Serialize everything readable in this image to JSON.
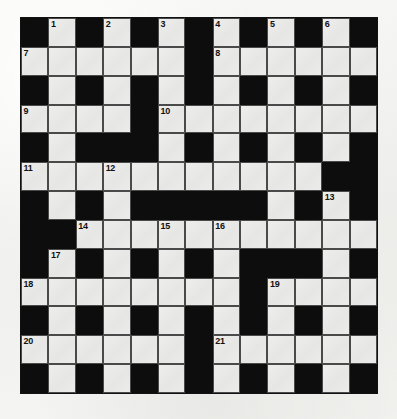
{
  "puzzle": {
    "type": "crossword-grid",
    "title": "Crossword Puzzle Grid",
    "columns": 13,
    "rows": 13,
    "colors": {
      "block": "#0d0d0d",
      "cell": "#e9e9e7",
      "cell_border": "#4a4a4a",
      "number_text": "#121212",
      "page_background": "#f2f2f0"
    },
    "legend": {
      "black": "blocked square",
      "white": "fillable letter square"
    },
    "grid": [
      [
        "black",
        "white",
        "black",
        "white",
        "black",
        "white",
        "black",
        "white",
        "black",
        "white",
        "black",
        "white",
        "black"
      ],
      [
        "white",
        "white",
        "white",
        "white",
        "white",
        "white",
        "black",
        "white",
        "white",
        "white",
        "white",
        "white",
        "white"
      ],
      [
        "black",
        "white",
        "black",
        "white",
        "black",
        "white",
        "black",
        "white",
        "black",
        "white",
        "black",
        "white",
        "black"
      ],
      [
        "white",
        "white",
        "white",
        "white",
        "black",
        "white",
        "white",
        "white",
        "white",
        "white",
        "white",
        "white",
        "white"
      ],
      [
        "black",
        "white",
        "black",
        "black",
        "black",
        "white",
        "black",
        "white",
        "black",
        "white",
        "black",
        "white",
        "black"
      ],
      [
        "white",
        "white",
        "white",
        "white",
        "white",
        "white",
        "white",
        "white",
        "white",
        "white",
        "white",
        "black",
        "black"
      ],
      [
        "black",
        "white",
        "black",
        "white",
        "black",
        "black",
        "black",
        "black",
        "black",
        "white",
        "black",
        "white",
        "black"
      ],
      [
        "black",
        "black",
        "white",
        "white",
        "white",
        "white",
        "white",
        "white",
        "white",
        "white",
        "white",
        "white",
        "white"
      ],
      [
        "black",
        "white",
        "black",
        "white",
        "black",
        "white",
        "black",
        "white",
        "black",
        "black",
        "black",
        "white",
        "black"
      ],
      [
        "white",
        "white",
        "white",
        "white",
        "white",
        "white",
        "white",
        "white",
        "black",
        "white",
        "white",
        "white",
        "white"
      ],
      [
        "black",
        "white",
        "black",
        "white",
        "black",
        "white",
        "black",
        "white",
        "black",
        "white",
        "black",
        "white",
        "black"
      ],
      [
        "white",
        "white",
        "white",
        "white",
        "white",
        "white",
        "black",
        "white",
        "white",
        "white",
        "white",
        "white",
        "white"
      ],
      [
        "black",
        "white",
        "black",
        "white",
        "black",
        "white",
        "black",
        "white",
        "black",
        "white",
        "black",
        "white",
        "black"
      ]
    ],
    "numbers": [
      {
        "row": 0,
        "col": 1,
        "label": "1"
      },
      {
        "row": 0,
        "col": 3,
        "label": "2"
      },
      {
        "row": 0,
        "col": 5,
        "label": "3"
      },
      {
        "row": 0,
        "col": 7,
        "label": "4"
      },
      {
        "row": 0,
        "col": 9,
        "label": "5"
      },
      {
        "row": 0,
        "col": 11,
        "label": "6"
      },
      {
        "row": 1,
        "col": 0,
        "label": "7"
      },
      {
        "row": 1,
        "col": 7,
        "label": "8"
      },
      {
        "row": 3,
        "col": 0,
        "label": "9"
      },
      {
        "row": 3,
        "col": 5,
        "label": "10"
      },
      {
        "row": 5,
        "col": 0,
        "label": "11"
      },
      {
        "row": 5,
        "col": 3,
        "label": "12"
      },
      {
        "row": 6,
        "col": 11,
        "label": "13"
      },
      {
        "row": 7,
        "col": 2,
        "label": "14"
      },
      {
        "row": 7,
        "col": 5,
        "label": "15"
      },
      {
        "row": 7,
        "col": 7,
        "label": "16"
      },
      {
        "row": 8,
        "col": 1,
        "label": "17"
      },
      {
        "row": 9,
        "col": 0,
        "label": "18"
      },
      {
        "row": 9,
        "col": 9,
        "label": "19"
      },
      {
        "row": 11,
        "col": 0,
        "label": "20"
      },
      {
        "row": 11,
        "col": 7,
        "label": "21"
      }
    ]
  }
}
